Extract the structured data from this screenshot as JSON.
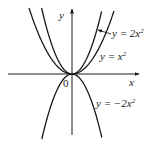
{
  "figure": {
    "axes": {
      "x_label": "x",
      "y_label": "y",
      "origin_label": "0"
    },
    "curves": [
      {
        "name": "y = 2x^2",
        "label_prefix": "y = 2x",
        "label_sup": "2",
        "coefficient": 2,
        "has_pointer_arrow": true
      },
      {
        "name": "y = x^2",
        "label_prefix": "y = x",
        "label_sup": "2",
        "coefficient": 1,
        "has_pointer_arrow": false
      },
      {
        "name": "y = -2x^2",
        "label_prefix": "y = −2x",
        "label_sup": "2",
        "coefficient": -2,
        "has_pointer_arrow": false
      }
    ],
    "colors": {
      "stroke": "#1a1a1a",
      "background": "#ffffff"
    }
  }
}
